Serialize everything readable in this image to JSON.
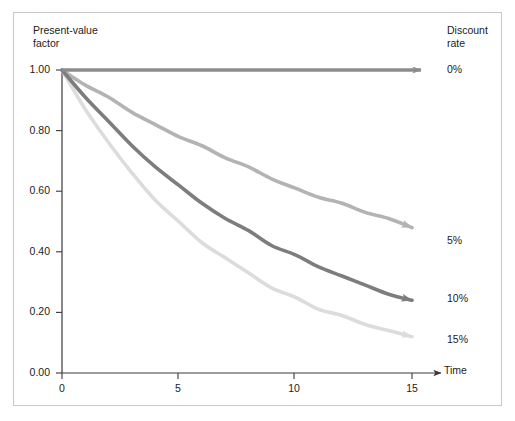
{
  "figure": {
    "background_color": "#ffffff",
    "frame_color": "#c9c9c9"
  },
  "chart_data": {
    "type": "line",
    "title": "",
    "subtitle": "",
    "xlabel": "Time",
    "ylabel": "Present-value\nfactor",
    "ylabel_line1": "Present-value",
    "ylabel_line2": "factor",
    "legend_title_line1": "Discount",
    "legend_title_line2": "rate",
    "legend_position": "right-of-curve-ends",
    "grid": false,
    "xlim": [
      0,
      17
    ],
    "ylim": [
      0.0,
      1.0
    ],
    "xticks": [
      0,
      5,
      10,
      15
    ],
    "xtick_labels": [
      "0",
      "5",
      "10",
      "15"
    ],
    "yticks": [
      0.0,
      0.2,
      0.4,
      0.6,
      0.8,
      1.0
    ],
    "ytick_labels": [
      "0.00",
      "0.20",
      "0.40",
      "0.60",
      "0.80",
      "1.00"
    ],
    "x": [
      0,
      1,
      2,
      3,
      4,
      5,
      6,
      7,
      8,
      9,
      10,
      11,
      12,
      13,
      14,
      15
    ],
    "series": [
      {
        "name": "0%",
        "rate": 0.0,
        "color": "#8c8c8c",
        "label": "0%",
        "values": [
          1.0,
          1.0,
          1.0,
          1.0,
          1.0,
          1.0,
          1.0,
          1.0,
          1.0,
          1.0,
          1.0,
          1.0,
          1.0,
          1.0,
          1.0,
          1.0
        ]
      },
      {
        "name": "5%",
        "rate": 0.05,
        "color": "#b3b3b3",
        "label": "5%",
        "values": [
          1.0,
          0.95,
          0.91,
          0.86,
          0.82,
          0.78,
          0.75,
          0.71,
          0.68,
          0.64,
          0.61,
          0.58,
          0.56,
          0.53,
          0.51,
          0.48
        ]
      },
      {
        "name": "10%",
        "rate": 0.1,
        "color": "#7d7d7d",
        "label": "10%",
        "values": [
          1.0,
          0.91,
          0.83,
          0.75,
          0.68,
          0.62,
          0.56,
          0.51,
          0.47,
          0.42,
          0.39,
          0.35,
          0.32,
          0.29,
          0.26,
          0.24
        ]
      },
      {
        "name": "15%",
        "rate": 0.15,
        "color": "#dcdcdc",
        "label": "15%",
        "values": [
          1.0,
          0.87,
          0.76,
          0.66,
          0.57,
          0.5,
          0.43,
          0.38,
          0.33,
          0.28,
          0.25,
          0.21,
          0.19,
          0.16,
          0.14,
          0.12
        ]
      }
    ]
  },
  "axes": {
    "y_tick_labels": [
      "1.00",
      "0.80",
      "0.60",
      "0.40",
      "0.20",
      "0.00"
    ],
    "x_tick_labels": [
      "0",
      "5",
      "10",
      "15"
    ],
    "x_axis_title": "Time"
  }
}
